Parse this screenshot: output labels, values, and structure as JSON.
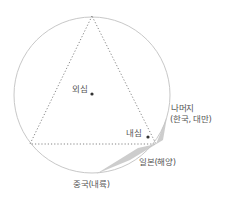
{
  "diagram": {
    "circle": {
      "cx": 92,
      "cy": 95,
      "r": 78,
      "stroke": "#c8c8c8"
    },
    "triangle": {
      "points": "92,16 30,144 156,144",
      "stroke": "#777777"
    },
    "circumcenter": {
      "label": "외심",
      "x": 92,
      "y": 94
    },
    "incenter": {
      "label": "내심",
      "x": 148,
      "y": 137
    },
    "shaded_region": {
      "points": "96,174 138,148 156,144 167,117 163,140 130,160",
      "fill": "#c4c4c4"
    },
    "labels": {
      "rest_line1": "나머지",
      "rest_line2": "(한국, 대만)",
      "japan": "일본(해양)",
      "china": "중국(내륙)"
    },
    "colors": {
      "text": "#555555",
      "dot": "#333333"
    }
  }
}
